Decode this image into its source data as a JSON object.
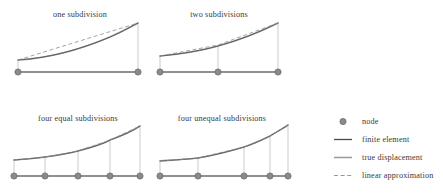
{
  "figure": {
    "background": "#ffffff",
    "colors": {
      "node_fill": "#8a8a8a",
      "node_stroke": "#6f6f6f",
      "finite_element": "#4a4a4a",
      "true_displacement": "#9a9a9a",
      "linear_approximation": "#8d8d8d",
      "baseline": "#6b6b6b",
      "drop_line": "#b5b5b5",
      "text": "#3a3a3a"
    }
  },
  "panels": [
    {
      "id": "one-subdivision",
      "title": "one subdivision",
      "title_x": 80,
      "title_y": 17,
      "baseline_y": 72,
      "baseline_x0": 18,
      "baseline_x1": 138,
      "nodes_x": [
        18,
        138
      ],
      "drop_lines": [
        {
          "x": 18,
          "y_top": 60,
          "y_bottom": 72
        },
        {
          "x": 138,
          "y_top": 23,
          "y_bottom": 72
        }
      ],
      "true_displacement": "M18,60 C52,58 84,48 110,37 C124,31 132,26 138,23",
      "linear_approximation": "M18,60 L138,23",
      "finite_element": "M18,60 C52,58 84,48 110,37 C124,31 132,26 138,23"
    },
    {
      "id": "two-subdivisions",
      "title": "two subdivisions",
      "title_x": 219,
      "title_y": 17,
      "baseline_y": 72,
      "baseline_x0": 160,
      "baseline_x1": 278,
      "nodes_x": [
        160,
        218,
        278
      ],
      "drop_lines": [
        {
          "x": 160,
          "y_top": 56,
          "y_bottom": 72
        },
        {
          "x": 218,
          "y_top": 46,
          "y_bottom": 72
        },
        {
          "x": 278,
          "y_top": 23,
          "y_bottom": 72
        }
      ],
      "true_displacement": "M160,56 C182,54 204,50 218,46 C240,40 262,31 278,23",
      "linear_approximation": "M160,56 L218,45 L278,23",
      "finite_element": "M160,56 C182,54 204,50 218,46 C240,40 262,31 278,23"
    },
    {
      "id": "four-equal-subdivisions",
      "title": "four equal subdivisions",
      "title_x": 78,
      "title_y": 121,
      "baseline_y": 176,
      "baseline_x0": 14,
      "baseline_x1": 140,
      "nodes_x": [
        14,
        45,
        78,
        110,
        140
      ],
      "drop_lines": [
        {
          "x": 14,
          "y_top": 160,
          "y_bottom": 176
        },
        {
          "x": 45,
          "y_top": 157,
          "y_bottom": 176
        },
        {
          "x": 78,
          "y_top": 151,
          "y_bottom": 176
        },
        {
          "x": 110,
          "y_top": 140,
          "y_bottom": 176
        },
        {
          "x": 140,
          "y_top": 126,
          "y_bottom": 176
        }
      ],
      "true_displacement": "M14,160 C28,159 38,158 45,157 C60,155 70,153 78,151 C93,147 103,144 110,140 C124,135 134,130 140,126",
      "linear_approximation": "M14,160 L45,157 L78,151 L110,140 L140,126",
      "finite_element": "M14,160 C28,159 38,158 45,157 C60,155 70,153 78,151 C93,147 103,144 110,140 C124,135 134,130 140,126"
    },
    {
      "id": "four-unequal-subdivisions",
      "title": "four unequal subdivisions",
      "title_x": 222,
      "title_y": 121,
      "baseline_y": 176,
      "baseline_x0": 160,
      "baseline_x1": 288,
      "nodes_x": [
        160,
        198,
        244,
        270,
        288
      ],
      "drop_lines": [
        {
          "x": 160,
          "y_top": 161,
          "y_bottom": 176
        },
        {
          "x": 198,
          "y_top": 158,
          "y_bottom": 176
        },
        {
          "x": 244,
          "y_top": 147,
          "y_bottom": 176
        },
        {
          "x": 270,
          "y_top": 136,
          "y_bottom": 176
        },
        {
          "x": 288,
          "y_top": 125,
          "y_bottom": 176
        }
      ],
      "true_displacement": "M160,161 C174,160 190,159 198,158 C216,155 234,150 244,147 C256,143 264,139 270,136 C278,131 284,128 288,125",
      "linear_approximation": "M160,161 L198,158 L244,147 L270,136 L288,125",
      "finite_element": "M160,161 C174,160 190,159 198,158 C216,155 234,150 244,147 C256,143 264,139 270,136 C278,131 284,128 288,125"
    }
  ],
  "legend": {
    "marker_x0": 334,
    "marker_x1": 352,
    "label_x": 362,
    "items": [
      {
        "id": "node",
        "label": "node",
        "type": "marker",
        "y": 124
      },
      {
        "id": "finite-element",
        "label": "finite element",
        "type": "solid-dark",
        "y": 142
      },
      {
        "id": "true-displacement",
        "label": "true displacement",
        "type": "solid-light",
        "y": 160
      },
      {
        "id": "linear-approximation",
        "label": "linear approximation",
        "type": "dashed",
        "y": 178
      }
    ]
  }
}
